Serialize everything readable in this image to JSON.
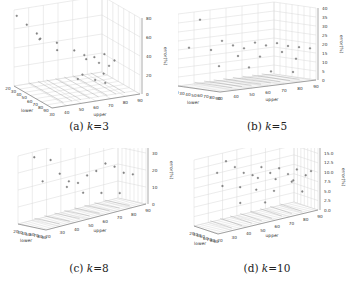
{
  "chart_data": [
    {
      "type": "scatter3d",
      "caption_prefix": "(a) ",
      "caption_var": "k",
      "caption_value": "=3",
      "xlabel": "lower",
      "ylabel": "upper",
      "zlabel": "error(%)",
      "x_ticks": [
        "20",
        "30",
        "40",
        "50",
        "60",
        "70",
        "80",
        "90"
      ],
      "y_ticks": [
        "30",
        "40",
        "50",
        "60",
        "70",
        "80",
        "90"
      ],
      "z_ticks": [
        "0",
        "20",
        "40",
        "60",
        "80"
      ],
      "zlim": [
        0,
        90
      ],
      "grid": true,
      "points": [
        [
          25,
          30,
          85
        ],
        [
          30,
          35,
          75
        ],
        [
          35,
          40,
          65
        ],
        [
          28,
          45,
          55
        ],
        [
          40,
          40,
          60
        ],
        [
          45,
          50,
          55
        ],
        [
          32,
          55,
          40
        ],
        [
          50,
          60,
          45
        ],
        [
          55,
          65,
          40
        ],
        [
          60,
          70,
          38
        ],
        [
          65,
          75,
          42
        ],
        [
          70,
          80,
          35
        ],
        [
          45,
          70,
          30
        ],
        [
          55,
          75,
          28
        ],
        [
          60,
          80,
          25
        ],
        [
          65,
          60,
          22
        ],
        [
          70,
          55,
          20
        ],
        [
          75,
          65,
          18
        ],
        [
          80,
          70,
          15
        ],
        [
          50,
          80,
          12
        ]
      ]
    },
    {
      "type": "scatter3d",
      "caption_prefix": "(b) ",
      "caption_var": "k",
      "caption_value": "=5",
      "xlabel": "lower",
      "ylabel": "upper",
      "zlabel": "error(%)",
      "x_ticks": [
        "20",
        "30",
        "40",
        "50",
        "60",
        "70",
        "80",
        "90"
      ],
      "y_ticks": [
        "30",
        "40",
        "50",
        "60",
        "70",
        "80",
        "90"
      ],
      "z_ticks": [
        "0",
        "5",
        "10",
        "15",
        "20",
        "25",
        "30",
        "35",
        "40"
      ],
      "zlim": [
        0,
        42
      ],
      "grid": true,
      "points": [
        [
          30,
          40,
          38
        ],
        [
          25,
          35,
          22
        ],
        [
          35,
          45,
          20
        ],
        [
          40,
          50,
          25
        ],
        [
          45,
          55,
          22
        ],
        [
          50,
          60,
          20
        ],
        [
          55,
          65,
          23
        ],
        [
          60,
          70,
          21
        ],
        [
          65,
          75,
          22
        ],
        [
          70,
          80,
          20
        ],
        [
          75,
          85,
          19
        ],
        [
          40,
          60,
          15
        ],
        [
          50,
          70,
          14
        ],
        [
          60,
          80,
          16
        ],
        [
          70,
          85,
          12
        ],
        [
          35,
          50,
          10
        ],
        [
          45,
          65,
          8
        ],
        [
          55,
          75,
          5
        ],
        [
          65,
          85,
          4
        ],
        [
          80,
          90,
          18
        ]
      ]
    },
    {
      "type": "scatter3d",
      "caption_prefix": "(c) ",
      "caption_var": "k",
      "caption_value": "=8",
      "xlabel": "lower",
      "ylabel": "upper",
      "zlabel": "error(%)",
      "x_ticks": [
        "20",
        "30",
        "40",
        "50",
        "60",
        "70",
        "80",
        "90"
      ],
      "y_ticks": [
        "20",
        "30",
        "40",
        "50",
        "60",
        "70",
        "80",
        "90"
      ],
      "z_ticks": [
        "0",
        "10",
        "20",
        "30",
        "40"
      ],
      "zlim": [
        0,
        45
      ],
      "grid": true,
      "points": [
        [
          25,
          30,
          42
        ],
        [
          30,
          40,
          38
        ],
        [
          35,
          45,
          28
        ],
        [
          28,
          35,
          25
        ],
        [
          40,
          50,
          22
        ],
        [
          45,
          55,
          20
        ],
        [
          50,
          60,
          24
        ],
        [
          55,
          65,
          26
        ],
        [
          60,
          70,
          30
        ],
        [
          65,
          75,
          27
        ],
        [
          70,
          80,
          22
        ],
        [
          75,
          85,
          20
        ],
        [
          40,
          60,
          12
        ],
        [
          50,
          70,
          10
        ],
        [
          60,
          80,
          8
        ],
        [
          35,
          50,
          18
        ]
      ]
    },
    {
      "type": "scatter3d",
      "caption_prefix": "(d) ",
      "caption_var": "k",
      "caption_value": "=10",
      "xlabel": "lower",
      "ylabel": "upper",
      "zlabel": "error(%)",
      "x_ticks": [
        "20",
        "30",
        "40",
        "50",
        "60",
        "70",
        "80",
        "90"
      ],
      "y_ticks": [
        "20",
        "30",
        "40",
        "50",
        "60",
        "70",
        "80",
        "90"
      ],
      "z_ticks": [
        "0.0",
        "2.5",
        "5.0",
        "7.5",
        "10.0",
        "12.5",
        "15.0",
        "17.5"
      ],
      "zlim": [
        0,
        19
      ],
      "grid": true,
      "points": [
        [
          30,
          40,
          17
        ],
        [
          25,
          35,
          14
        ],
        [
          35,
          45,
          15
        ],
        [
          40,
          50,
          13
        ],
        [
          45,
          55,
          12
        ],
        [
          50,
          60,
          14
        ],
        [
          55,
          65,
          12
        ],
        [
          60,
          70,
          13
        ],
        [
          65,
          75,
          11
        ],
        [
          70,
          80,
          12
        ],
        [
          75,
          85,
          10
        ],
        [
          28,
          38,
          10
        ],
        [
          38,
          48,
          9
        ],
        [
          48,
          58,
          11
        ],
        [
          58,
          68,
          10
        ],
        [
          68,
          78,
          9
        ],
        [
          78,
          88,
          11
        ],
        [
          35,
          60,
          7
        ],
        [
          45,
          70,
          6
        ],
        [
          55,
          80,
          8
        ],
        [
          65,
          85,
          5
        ],
        [
          30,
          50,
          4
        ],
        [
          40,
          65,
          3
        ]
      ]
    }
  ]
}
